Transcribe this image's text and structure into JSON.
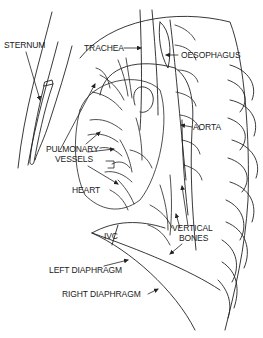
{
  "diagram": {
    "type": "anatomical line drawing",
    "line_color": "#222222",
    "background": "#ffffff",
    "labels": {
      "sternum": "STERNUM",
      "trachea": "TRACHEA",
      "oesophagus": "OESOPHAGUS",
      "aorta": "AORTA",
      "pulmonary_vessels_1": "PULMONARY",
      "pulmonary_vessels_2": "VESSELS",
      "heart": "HEART",
      "vertical_bones_1": "VERTICAL",
      "vertical_bones_2": "BONES",
      "ivc": "IVC",
      "left_diaphragm": "LEFT DIAPHRAGM",
      "right_diaphragm": "RIGHT DIAPHRAGM"
    }
  }
}
